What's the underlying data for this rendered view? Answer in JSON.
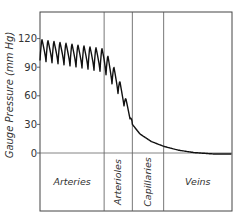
{
  "chart_data": {
    "type": "line",
    "title": "",
    "xlabel": "",
    "ylabel": "Gauge Pressure (mm Hg)",
    "ylim": [
      0,
      125
    ],
    "yticks": [
      0,
      30,
      60,
      90,
      120
    ],
    "ytick_labels": [
      "0",
      "30",
      "60",
      "90",
      "120"
    ],
    "grid": false,
    "legend": null,
    "regions": [
      {
        "name": "Arteries",
        "x_start": 0,
        "x_end": 0.334,
        "label_orientation": "horizontal"
      },
      {
        "name": "Arterioles",
        "x_start": 0.334,
        "x_end": 0.481,
        "label_orientation": "vertical"
      },
      {
        "name": "Capillaries",
        "x_start": 0.481,
        "x_end": 0.644,
        "label_orientation": "vertical"
      },
      {
        "name": "Veins",
        "x_start": 0.644,
        "x_end": 1.0,
        "label_orientation": "horizontal"
      }
    ],
    "series": [
      {
        "name": "Blood pressure",
        "description": "Pulsatile in arteries (systolic ~120 to diastolic ~97 at start, decreasing to ~110/85), pulsations dampen through arterioles while mean pressure falls steeply to ~30, then smooth decline through capillaries (~30 to ~7) and veins (~7 to ~0).",
        "envelope": {
          "x": [
            0.0,
            0.334,
            0.4,
            0.46,
            0.481
          ],
          "max": [
            120,
            110,
            85,
            50,
            32
          ],
          "min": [
            97,
            85,
            65,
            40,
            30
          ]
        },
        "smooth": {
          "x": [
            0.481,
            0.52,
            0.58,
            0.644,
            0.72,
            0.8,
            0.9,
            1.0
          ],
          "y": [
            30,
            20,
            12,
            7,
            3,
            0.5,
            -1,
            -1
          ]
        }
      }
    ]
  }
}
